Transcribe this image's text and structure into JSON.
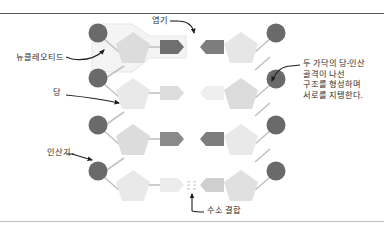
{
  "figure": {
    "title_region": "dna-structure-diagram",
    "labels": {
      "nucleotide": "뉴클레오티드",
      "sugar": "당",
      "phosphate": "인산기",
      "base": "염기",
      "hydrogen_bond": "수소 결합",
      "backbone_note_line1": "두 가닥의 당-인산",
      "backbone_note_line2": "골격이 나선",
      "backbone_note_line3": "구조를 형성하며",
      "backbone_note_line4": "서로를 지탱한다."
    },
    "colors": {
      "phosphate_circle": "#6b6b6b",
      "sugar_pentagon_dark": "#d8d8d8",
      "sugar_pentagon_light": "#ebebeb",
      "base_dark": "#7a7a7a",
      "base_light": "#e3e3e3",
      "connector": "#bdbdbd",
      "highlight_outline": "#efefef",
      "text": "#2b2b2b",
      "rule_top": "#555a5e",
      "rule_bottom": "#b9bcc0",
      "background": "#ffffff"
    },
    "rungs": [
      {
        "index": 1,
        "left_base_tone": "dark",
        "right_base_tone": "dark",
        "hbond_dots": 3
      },
      {
        "index": 2,
        "left_base_tone": "light",
        "right_base_tone": "light",
        "hbond_dots": 3
      },
      {
        "index": 3,
        "left_base_tone": "dark",
        "right_base_tone": "dark",
        "hbond_dots": 3
      },
      {
        "index": 4,
        "left_base_tone": "light",
        "right_base_tone": "mid",
        "hbond_dots": 3
      }
    ]
  }
}
